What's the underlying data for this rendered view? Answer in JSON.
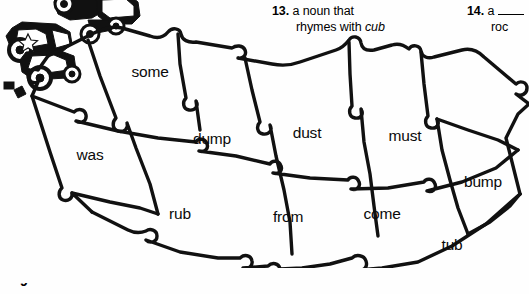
{
  "page": {
    "background_color": "#fefefe",
    "ink_color": "#000000",
    "width": 529,
    "height": 294
  },
  "clipart": {
    "name": "toy-dump-trucks-illustration",
    "description": "black line-art drawing of two toy dump trucks, cropped at the top edge"
  },
  "clues": {
    "items": [
      {
        "number": "13.",
        "line1": "a noun that",
        "line2_prefix": "rhymes with ",
        "line2_italic": "cub",
        "line2_suffix": ""
      },
      {
        "number": "14.",
        "line1_prefix": "a ",
        "line1_blank": "____",
        "line2": "roc"
      }
    ]
  },
  "puzzle": {
    "name": "jigsaw-word-puzzle",
    "cells": [
      {
        "id": "cell-some",
        "word": "some",
        "x": 150,
        "y": 54
      },
      {
        "id": "cell-was",
        "word": "was",
        "x": 90,
        "y": 137
      },
      {
        "id": "cell-dump",
        "word": "dump",
        "x": 212,
        "y": 121
      },
      {
        "id": "cell-dust",
        "word": "dust",
        "x": 307,
        "y": 115
      },
      {
        "id": "cell-must",
        "word": "must",
        "x": 405,
        "y": 118
      },
      {
        "id": "cell-bump",
        "word": "bump",
        "x": 483,
        "y": 164
      },
      {
        "id": "cell-rub",
        "word": "rub",
        "x": 180,
        "y": 196
      },
      {
        "id": "cell-from",
        "word": "from",
        "x": 288,
        "y": 199
      },
      {
        "id": "cell-come",
        "word": "come",
        "x": 382,
        "y": 196
      },
      {
        "id": "cell-tub",
        "word": "tub",
        "x": 452,
        "y": 227
      }
    ]
  },
  "bottom_fragment": {
    "text": "9",
    "note": "partially cropped character at bottom-left edge"
  }
}
